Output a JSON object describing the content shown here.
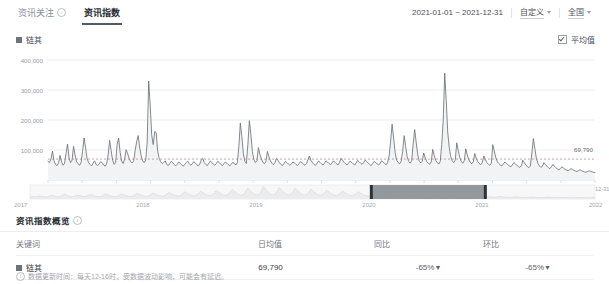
{
  "tabs": [
    {
      "label": "资讯关注",
      "active": false,
      "icon": "info-icon"
    },
    {
      "label": "资讯指数",
      "active": true,
      "icon": null
    }
  ],
  "toolbar": {
    "date_range": "2021-01-01 ~ 2021-12-31",
    "range_preset": "自定义",
    "region": "全国",
    "caret_icon": "chevron-down-icon"
  },
  "chart_header": {
    "legend_label": "链其",
    "legend_color": "#6e737c",
    "average_label": "平均值",
    "average_checked": true
  },
  "overview": {
    "title": "资讯指数概览",
    "info_icon": "info-icon",
    "columns": [
      "关键词",
      "日均值",
      "同比",
      "环比"
    ],
    "rows": [
      {
        "keyword": "链其",
        "color": "#6e737c",
        "daily_average": "69,790",
        "yoy": "-65%",
        "yoy_arrow": "▼",
        "mom": "-65%",
        "mom_arrow": "▼"
      }
    ],
    "footnote_marker": "①",
    "footnote": "数据更新时间：每天12-16时，受数据波动影响，可能会有延迟。"
  },
  "brush": {
    "years": [
      "2017",
      "2018",
      "2019",
      "2020",
      "2021",
      "2022"
    ],
    "selection_start_label": "2021",
    "selection_end_label": "2022",
    "selected_from_fraction": 0.605,
    "selected_to_fraction": 0.805
  },
  "chart_data": {
    "type": "line",
    "title": "",
    "xlabel": "",
    "ylabel": "",
    "ylim": [
      0,
      420000
    ],
    "yticks": [
      100000,
      200000,
      300000,
      400000
    ],
    "ytick_labels": [
      "100,000",
      "200,000",
      "300,000",
      "400,000"
    ],
    "grid": true,
    "legend_position": "top-left",
    "series_name": "链其",
    "series_color": "#6e737c",
    "average_line": 69790,
    "average_label": "69,790",
    "x_tick_labels": [
      "2021-01-22",
      "2021-02-12",
      "2021-03-05",
      "2021-03-26",
      "2021-04-16",
      "2021-05-07",
      "2021-05-28",
      "2021-06-18",
      "2021-07-09",
      "2021-07-30",
      "2021-08-20",
      "2021-09-10",
      "2021-10-01",
      "2021-10-22",
      "2021-11-12",
      "2021-12-03",
      "2021-12-31"
    ],
    "x_start": "2021-01-01",
    "x_end": "2021-12-31",
    "values": [
      62000,
      58000,
      71000,
      96000,
      64000,
      52000,
      48000,
      57000,
      82000,
      60000,
      49000,
      55000,
      88000,
      120000,
      74000,
      58000,
      66000,
      112000,
      83000,
      61000,
      55000,
      49000,
      58000,
      96000,
      140000,
      108000,
      72000,
      58000,
      52000,
      47000,
      56000,
      64000,
      52000,
      48000,
      53000,
      61000,
      58000,
      50000,
      46000,
      54000,
      83000,
      132000,
      99000,
      66000,
      52000,
      58000,
      119000,
      140000,
      92000,
      63000,
      55000,
      70000,
      101000,
      88000,
      72000,
      61000,
      57000,
      64000,
      98000,
      128000,
      148000,
      110000,
      81000,
      64000,
      58000,
      66000,
      126000,
      330000,
      250000,
      150000,
      118000,
      162000,
      158000,
      96000,
      72000,
      61000,
      55000,
      58000,
      64000,
      52000,
      48000,
      55000,
      62000,
      58000,
      51000,
      47000,
      53000,
      60000,
      56000,
      50000,
      46000,
      52000,
      58000,
      63000,
      55000,
      49000,
      54000,
      61000,
      57000,
      51000,
      47000,
      53000,
      66000,
      72000,
      58000,
      52000,
      48000,
      56000,
      63000,
      59000,
      53000,
      49000,
      55000,
      62000,
      58000,
      52000,
      48000,
      54000,
      60000,
      56000,
      51000,
      47000,
      53000,
      59000,
      55000,
      50000,
      58000,
      112000,
      190000,
      145000,
      88000,
      62000,
      55000,
      118000,
      198000,
      152000,
      95000,
      68000,
      58000,
      64000,
      108000,
      86000,
      70000,
      59000,
      54000,
      62000,
      95000,
      78000,
      64000,
      56000,
      51000,
      58000,
      72000,
      66000,
      58000,
      52000,
      48000,
      55000,
      62000,
      58000,
      53000,
      49000,
      54000,
      60000,
      57000,
      52000,
      48000,
      54000,
      61000,
      58000,
      53000,
      49000,
      55000,
      68000,
      80000,
      66000,
      58000,
      52000,
      49000,
      56000,
      63000,
      59000,
      54000,
      50000,
      56000,
      64000,
      60000,
      55000,
      51000,
      57000,
      64000,
      59000,
      54000,
      50000,
      58000,
      72000,
      66000,
      59000,
      54000,
      50000,
      56000,
      63000,
      59000,
      54000,
      50000,
      57000,
      65000,
      61000,
      56000,
      52000,
      58000,
      66000,
      62000,
      57000,
      52000,
      48000,
      55000,
      62000,
      58000,
      54000,
      50000,
      56000,
      64000,
      60000,
      55000,
      51000,
      58000,
      80000,
      130000,
      186000,
      140000,
      92000,
      66000,
      58000,
      54000,
      62000,
      96000,
      148000,
      112000,
      78000,
      62000,
      56000,
      64000,
      120000,
      168000,
      126000,
      86000,
      64000,
      57000,
      62000,
      90000,
      74000,
      62000,
      56000,
      52000,
      60000,
      102000,
      82000,
      66000,
      58000,
      53000,
      62000,
      118000,
      200000,
      356000,
      265000,
      160000,
      108000,
      78000,
      64000,
      58000,
      66000,
      124000,
      98000,
      76000,
      62000,
      56000,
      64000,
      104000,
      84000,
      68000,
      59000,
      54000,
      61000,
      88000,
      72000,
      61000,
      55000,
      51000,
      58000,
      80000,
      68000,
      58000,
      53000,
      49000,
      56000,
      118000,
      96000,
      74000,
      61000,
      55000,
      50000,
      47000,
      53000,
      60000,
      56000,
      51000,
      47000,
      44000,
      50000,
      58000,
      54000,
      49000,
      45000,
      42000,
      48000,
      66000,
      58000,
      50000,
      45000,
      41000,
      47000,
      90000,
      138000,
      104000,
      72000,
      56000,
      47000,
      42000,
      46000,
      58000,
      52000,
      46000,
      41000,
      38000,
      44000,
      52000,
      46000,
      41000,
      37000,
      34000,
      38000,
      44000,
      40000,
      36000,
      33000,
      31000,
      34000,
      38000,
      35000,
      32000,
      30000,
      28000,
      31000,
      34000,
      31000,
      29000,
      27000,
      26000,
      28000,
      31000,
      29000,
      27000,
      26000,
      25000
    ],
    "brush_values": [
      38000,
      52000,
      44000,
      68000,
      55000,
      40000,
      62000,
      90000,
      58000,
      44000,
      72000,
      120000,
      68000,
      48000,
      58000,
      96000,
      74000,
      52000,
      66000,
      110000,
      82000,
      58000,
      46000,
      70000,
      130000,
      88000,
      60000,
      48000,
      76000,
      118000,
      92000,
      64000,
      52000,
      80000,
      140000,
      100000,
      70000,
      56000,
      88000,
      150000,
      110000,
      76000,
      60000,
      94000,
      165000,
      120000,
      84000,
      64000,
      100000,
      180000,
      130000,
      90000,
      70000,
      108000,
      200000,
      145000,
      96000,
      74000,
      114000,
      220000,
      160000,
      104000,
      80000,
      125000,
      250000,
      175000,
      112000,
      86000,
      135000,
      290000,
      195000,
      124000,
      92000,
      145000,
      330000,
      210000,
      132000,
      96000,
      150000,
      300000,
      205000,
      128000,
      94000,
      142000,
      280000,
      190000,
      120000,
      90000,
      134000,
      260000,
      175000,
      112000,
      86000,
      124000,
      230000,
      160000,
      104000,
      80000,
      116000,
      205000,
      146000,
      96000,
      74000,
      108000,
      185000,
      132000,
      88000,
      68000,
      98000,
      165000,
      118000,
      80000,
      62000,
      88000,
      145000,
      104000,
      72000,
      56000,
      78000,
      126000,
      92000,
      64000,
      50000,
      70000,
      108000,
      80000,
      58000,
      46000,
      62000,
      94000,
      70000,
      52000,
      42000,
      56000,
      82000,
      62000,
      46000,
      38000,
      50000,
      72000,
      54000,
      42000,
      34000,
      44000,
      62000,
      48000,
      38000,
      31000,
      40000,
      55000,
      43000,
      34000,
      28000,
      36000,
      48000,
      38000,
      30000,
      26000,
      32000,
      42000,
      34000,
      28000,
      24000,
      29000,
      38000,
      31000,
      26000,
      22000,
      26000,
      34000,
      28000,
      24000,
      21000,
      24000,
      30000,
      26000,
      22000,
      20000,
      22000,
      27000
    ]
  }
}
